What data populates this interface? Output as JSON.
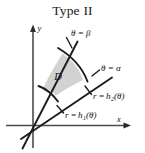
{
  "figure": {
    "title": "Type II",
    "background_color": "#ffffff",
    "region_fill_color": "#d2d2d2",
    "stroke_color": "#1c1c1c",
    "axis_color": "#4c4c4c",
    "axes": {
      "x_label": "x",
      "y_label": "y",
      "origin_label": ""
    },
    "region": {
      "letter": "D"
    },
    "labels": {
      "theta_beta": {
        "theta": "θ",
        "equals": "=",
        "value": "β",
        "full": "θ = β"
      },
      "theta_alpha": {
        "theta": "θ",
        "equals": "=",
        "value": "α",
        "full": "θ = α"
      },
      "r_h2": {
        "r": "r",
        "equals": "=",
        "fn": "h",
        "sub": "2",
        "arg": "(θ)",
        "full": "r = h₂(θ)"
      },
      "r_h1": {
        "r": "r",
        "equals": "=",
        "fn": "h",
        "sub": "1",
        "arg": "(θ)",
        "full": "r = h₁(θ)"
      }
    }
  }
}
